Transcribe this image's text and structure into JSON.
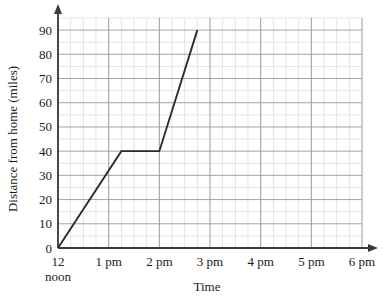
{
  "chart_data": {
    "type": "line",
    "title": "",
    "xlabel": "Time",
    "ylabel": "Distance from home (miles)",
    "xlim": [
      0,
      6
    ],
    "ylim": [
      0,
      95
    ],
    "grid": true,
    "legend": "none",
    "x_tick_labels": [
      "12",
      "1 pm",
      "2 pm",
      "3 pm",
      "4 pm",
      "5 pm",
      "6 pm"
    ],
    "x_tick_sublabels": [
      "noon",
      "",
      "",
      "",
      "",
      "",
      ""
    ],
    "x_tick_values": [
      0,
      1,
      2,
      3,
      4,
      5,
      6
    ],
    "y_tick_labels": [
      "0",
      "10",
      "20",
      "30",
      "40",
      "50",
      "60",
      "70",
      "80",
      "90"
    ],
    "y_tick_values": [
      0,
      10,
      20,
      30,
      40,
      50,
      60,
      70,
      80,
      90
    ],
    "x_minor_per_major": 4,
    "y_minor_per_major": 2,
    "series": [
      {
        "name": "journey",
        "color": "#2b2b2b",
        "points": [
          {
            "x": 0.0,
            "y": 0,
            "time": "12 noon",
            "distance": 0
          },
          {
            "x": 1.25,
            "y": 40,
            "time": "1:15 pm",
            "distance": 40
          },
          {
            "x": 2.0,
            "y": 40,
            "time": "2 pm",
            "distance": 40
          },
          {
            "x": 2.75,
            "y": 90,
            "time": "2:45 pm",
            "distance": 90
          }
        ]
      }
    ]
  },
  "axes": {
    "y_axis_title": "Distance from home (miles)",
    "x_axis_title": "Time"
  },
  "colors": {
    "line": "#2b2b2b",
    "axis": "#3a3a3a",
    "grid_major": "#9a9a9a",
    "grid_minor": "#d8d8d8",
    "background": "#ffffff",
    "text": "#1a1a1a"
  }
}
